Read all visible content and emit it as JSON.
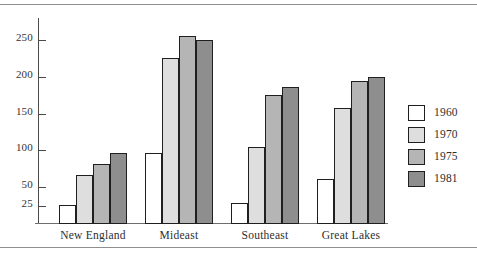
{
  "chart_data": {
    "type": "bar",
    "title": "",
    "subtitle": "",
    "xlabel": "",
    "ylabel": "",
    "categories": [
      "New England",
      "Mideast",
      "Southeast",
      "Great Lakes"
    ],
    "series": [
      {
        "name": "1960",
        "color": "#ffffff",
        "values": [
          26,
          97,
          28,
          61
        ]
      },
      {
        "name": "1970",
        "color": "#dedede",
        "values": [
          66,
          225,
          105,
          158
        ]
      },
      {
        "name": "1975",
        "color": "#b5b5b5",
        "values": [
          81,
          256,
          175,
          195
        ]
      },
      {
        "name": "1981",
        "color": "#8e8e8e",
        "values": [
          97,
          250,
          186,
          200
        ]
      }
    ],
    "yticks": [
      25,
      50,
      100,
      150,
      200,
      250
    ],
    "ytick_labels": [
      "25",
      "50",
      "100",
      "150",
      "200",
      "250"
    ],
    "ylim": [
      0,
      280
    ],
    "grid": false,
    "legend_position": "right",
    "legend_entries": [
      "1960",
      "1970",
      "1975",
      "1981"
    ]
  },
  "figure": {
    "top_rule": "",
    "bottom_rule": ""
  }
}
